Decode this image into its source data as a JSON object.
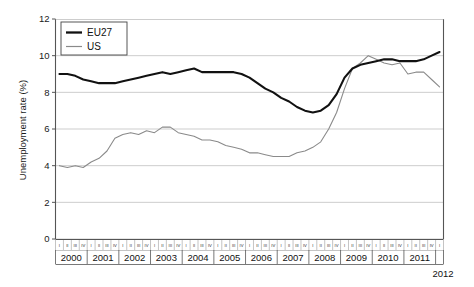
{
  "chart_data": {
    "type": "line",
    "title": "",
    "xlabel": "",
    "ylabel": "Unemployment rate (%)",
    "ylim": [
      0,
      12
    ],
    "yticks": [
      0,
      2,
      4,
      6,
      8,
      10,
      12
    ],
    "grid": true,
    "legend_position": "top-left",
    "x_axis_style": "quarterly ticks grouped by year",
    "quarter_labels": [
      "I",
      "II",
      "III",
      "IV"
    ],
    "years": [
      "2000",
      "2001",
      "2002",
      "2003",
      "2004",
      "2005",
      "2006",
      "2007",
      "2008",
      "2009",
      "2010",
      "2011"
    ],
    "trailing_year_label": "2012",
    "x": [
      "2000-I",
      "2000-II",
      "2000-III",
      "2000-IV",
      "2001-I",
      "2001-II",
      "2001-III",
      "2001-IV",
      "2002-I",
      "2002-II",
      "2002-III",
      "2002-IV",
      "2003-I",
      "2003-II",
      "2003-III",
      "2003-IV",
      "2004-I",
      "2004-II",
      "2004-III",
      "2004-IV",
      "2005-I",
      "2005-II",
      "2005-III",
      "2005-IV",
      "2006-I",
      "2006-II",
      "2006-III",
      "2006-IV",
      "2007-I",
      "2007-II",
      "2007-III",
      "2007-IV",
      "2008-I",
      "2008-II",
      "2008-III",
      "2008-IV",
      "2009-I",
      "2009-II",
      "2009-III",
      "2009-IV",
      "2010-I",
      "2010-II",
      "2010-III",
      "2010-IV",
      "2011-I",
      "2011-II",
      "2011-III",
      "2011-IV",
      "2012-I"
    ],
    "series": [
      {
        "name": "EU27",
        "color": "#111111",
        "width": "thick",
        "values": [
          9.0,
          9.0,
          8.9,
          8.7,
          8.6,
          8.5,
          8.5,
          8.5,
          8.6,
          8.7,
          8.8,
          8.9,
          9.0,
          9.1,
          9.0,
          9.1,
          9.2,
          9.3,
          9.1,
          9.1,
          9.1,
          9.1,
          9.1,
          9.0,
          8.8,
          8.5,
          8.2,
          8.0,
          7.7,
          7.5,
          7.2,
          7.0,
          6.9,
          7.0,
          7.3,
          7.9,
          8.8,
          9.3,
          9.5,
          9.6,
          9.7,
          9.8,
          9.8,
          9.7,
          9.7,
          9.7,
          9.8,
          10.0,
          10.2
        ]
      },
      {
        "name": "US",
        "color": "#8a8a8a",
        "width": "thin",
        "values": [
          4.0,
          3.9,
          4.0,
          3.9,
          4.2,
          4.4,
          4.8,
          5.5,
          5.7,
          5.8,
          5.7,
          5.9,
          5.8,
          6.1,
          6.1,
          5.8,
          5.7,
          5.6,
          5.4,
          5.4,
          5.3,
          5.1,
          5.0,
          4.9,
          4.7,
          4.7,
          4.6,
          4.5,
          4.5,
          4.5,
          4.7,
          4.8,
          5.0,
          5.3,
          6.0,
          6.9,
          8.2,
          9.3,
          9.6,
          10.0,
          9.8,
          9.6,
          9.5,
          9.6,
          9.0,
          9.1,
          9.1,
          8.7,
          8.3
        ]
      }
    ]
  },
  "legend": {
    "items": [
      {
        "label": "EU27"
      },
      {
        "label": "US"
      }
    ]
  },
  "yaxis": {
    "title": "Unemployment rate (%)",
    "labels": [
      "12",
      "10",
      "8",
      "6",
      "4",
      "2",
      "0"
    ]
  },
  "xaxis": {
    "years": [
      "2000",
      "2001",
      "2002",
      "2003",
      "2004",
      "2005",
      "2006",
      "2007",
      "2008",
      "2009",
      "2010",
      "2011"
    ],
    "quarters": [
      "I",
      "II",
      "III",
      "IV"
    ],
    "end_year": "2012"
  }
}
